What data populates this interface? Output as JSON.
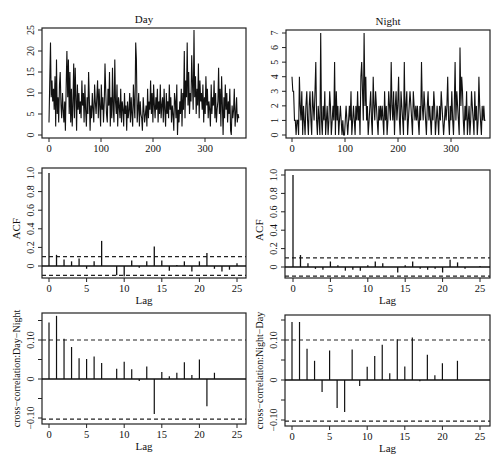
{
  "caption_fragment": "",
  "chart_data": [
    {
      "id": "day-series",
      "type": "line",
      "title": "Day",
      "xlabel": "",
      "ylabel": "",
      "xlim": [
        0,
        365
      ],
      "ylim": [
        0,
        25
      ],
      "xticks": [
        0,
        100,
        200,
        300
      ],
      "yticks": [
        0,
        5,
        10,
        15,
        20,
        25
      ],
      "grid": false,
      "box": {
        "x0": 42,
        "x1": 246,
        "y0": 28,
        "y1": 138,
        "px_x0": 49,
        "px_x1": 205,
        "val_x0": 0,
        "val_x1": 300,
        "px_y0": 135,
        "px_y1": 30,
        "val_y0": 0,
        "val_y1": 25
      },
      "values_sample": [
        3,
        12,
        22,
        9,
        13,
        8,
        11,
        6,
        14,
        2,
        18,
        5,
        9,
        3,
        12,
        15,
        7,
        4,
        10,
        6,
        3,
        8,
        1,
        12,
        20,
        9,
        18,
        5,
        15,
        3,
        11,
        2,
        7,
        17,
        4,
        16,
        9,
        1,
        12,
        6,
        10,
        5,
        8,
        4,
        13,
        7,
        10,
        3,
        12,
        6,
        2,
        9,
        5,
        15,
        8,
        1,
        7,
        4,
        10,
        6,
        3,
        12,
        8,
        5,
        9,
        13,
        4,
        11,
        7,
        2,
        12,
        6,
        9,
        3,
        8,
        17,
        10,
        5,
        3,
        11,
        7,
        15,
        2,
        9,
        4,
        16,
        6,
        3,
        18,
        8,
        5,
        12,
        2,
        9,
        7,
        4,
        11,
        3,
        8,
        6,
        2,
        10,
        5,
        7,
        1,
        8,
        4,
        6,
        10,
        3,
        9,
        5,
        2,
        12,
        7,
        4,
        22,
        18,
        3,
        6,
        10,
        2,
        8,
        5,
        4,
        1,
        9,
        6,
        3,
        5,
        7,
        2,
        11,
        4,
        8,
        6,
        13,
        5,
        10,
        3,
        12,
        7,
        4,
        9,
        6,
        11,
        3,
        8,
        5,
        12,
        4,
        7,
        9,
        3,
        11,
        6,
        2,
        10,
        5,
        8,
        4,
        12,
        6,
        9,
        3,
        7,
        5,
        1,
        10,
        8,
        4,
        12,
        0,
        6,
        3,
        8,
        5,
        11,
        2,
        10,
        6,
        20,
        4,
        13,
        9,
        22,
        7,
        15,
        5,
        10,
        8,
        19,
        12,
        6,
        25,
        9,
        14,
        5,
        11,
        7,
        17,
        4,
        13,
        8,
        10,
        6,
        12,
        3,
        9,
        5,
        14,
        7,
        11,
        4,
        8,
        6,
        2,
        12,
        5,
        9,
        7,
        13,
        4,
        10,
        3,
        6,
        8,
        16,
        5,
        11,
        2,
        14,
        7,
        0,
        9,
        4,
        12,
        6,
        10,
        3,
        8,
        5,
        11,
        1,
        0,
        7,
        4,
        6,
        11,
        2,
        5,
        9,
        3,
        5,
        4
      ]
    },
    {
      "id": "night-series",
      "type": "line",
      "title": "Night",
      "xlabel": "",
      "ylabel": "",
      "xlim": [
        0,
        365
      ],
      "ylim": [
        0,
        7
      ],
      "xticks": [
        0,
        100,
        200,
        300
      ],
      "yticks": [
        0,
        1,
        2,
        3,
        4,
        5,
        6,
        7
      ],
      "grid": false,
      "box": {
        "x0": 286,
        "x1": 490,
        "y0": 30,
        "y1": 138,
        "px_x0": 292,
        "px_x1": 451,
        "val_x0": 0,
        "val_x1": 300,
        "px_y0": 135,
        "px_y1": 33,
        "val_y0": 0,
        "val_y1": 7
      },
      "values_sample": [
        4,
        3,
        3,
        1,
        1,
        0,
        1,
        1,
        0,
        4,
        2,
        1,
        3,
        0,
        2,
        1,
        0,
        2,
        3,
        1,
        0,
        2,
        3,
        1,
        0,
        3,
        2,
        1,
        3,
        5,
        1,
        0,
        2,
        1,
        0,
        7,
        1,
        0,
        2,
        1,
        3,
        0,
        1,
        2,
        0,
        1,
        3,
        2,
        0,
        1,
        2,
        1,
        5,
        0,
        3,
        1,
        2,
        0,
        1,
        2,
        1,
        0,
        1,
        0,
        0,
        1,
        2,
        1,
        0,
        1,
        2,
        1,
        3,
        0,
        1,
        2,
        1,
        0,
        2,
        1,
        3,
        1,
        2,
        0,
        4,
        5,
        3,
        1,
        7,
        2,
        4,
        1,
        2,
        0,
        1,
        2,
        3,
        1,
        0,
        4,
        2,
        1,
        3,
        2,
        1,
        0,
        2,
        1,
        2,
        1,
        2,
        1,
        0,
        3,
        1,
        2,
        0,
        1,
        3,
        2,
        1,
        5,
        2,
        1,
        3,
        0,
        2,
        3,
        1,
        2,
        4,
        1,
        0,
        3,
        2,
        1,
        0,
        5,
        1,
        2,
        3,
        0,
        1,
        2,
        3,
        2,
        1,
        0,
        3,
        2,
        1,
        2,
        1,
        2,
        1,
        0,
        2,
        1,
        5,
        2,
        1,
        3,
        2,
        1,
        0,
        2,
        3,
        1,
        2,
        1,
        0,
        2,
        1,
        3,
        2,
        0,
        1,
        2,
        1,
        0,
        2,
        1,
        3,
        2,
        1,
        0,
        1,
        2,
        1,
        2,
        4,
        1,
        0,
        2,
        1,
        3,
        1,
        0,
        2,
        5,
        1,
        3,
        2,
        1,
        0,
        6,
        2,
        4,
        3,
        1,
        0,
        2,
        1,
        3,
        0,
        1,
        2,
        0,
        1,
        3,
        2,
        1,
        0,
        3,
        1,
        2,
        0,
        1,
        4,
        2,
        1,
        0,
        2,
        1,
        2,
        1,
        1
      ]
    },
    {
      "id": "acf-day",
      "type": "bar",
      "title": "",
      "xlabel": "Lag",
      "ylabel": "ACF",
      "xlim": [
        -1,
        26
      ],
      "ylim": [
        -0.13,
        1.05
      ],
      "xticks": [
        0,
        5,
        10,
        15,
        20,
        25
      ],
      "yticks": [
        0,
        0.2,
        0.4,
        0.6,
        0.8,
        1.0
      ],
      "ytick_labels": [
        "0",
        "0.2",
        "0.4",
        "0.6",
        "0.8",
        "1.0"
      ],
      "confidence_band": [
        0.1,
        -0.1
      ],
      "lags": [
        0,
        1,
        2,
        3,
        4,
        5,
        6,
        7,
        8,
        9,
        10,
        11,
        12,
        13,
        14,
        15,
        16,
        17,
        18,
        19,
        20,
        21,
        22,
        23,
        24,
        25
      ],
      "values": [
        1.0,
        0.12,
        0.07,
        0.05,
        0.08,
        -0.03,
        0.05,
        0.27,
        0.0,
        -0.1,
        -0.11,
        0.06,
        -0.02,
        0.05,
        0.21,
        0.06,
        -0.05,
        0.01,
        0.05,
        -0.06,
        0.05,
        0.14,
        -0.03,
        -0.06,
        -0.04,
        0.03
      ],
      "box": {
        "x0": 42,
        "x1": 246,
        "y0": 168,
        "y1": 278,
        "px_lag0": 49,
        "px_lag25": 237,
        "px_y0": 266,
        "px_y1": 173
      }
    },
    {
      "id": "acf-night",
      "type": "bar",
      "title": "",
      "xlabel": "Lag",
      "ylabel": "ACF",
      "xlim": [
        -1,
        26
      ],
      "ylim": [
        -0.13,
        1.05
      ],
      "xticks": [
        0,
        5,
        10,
        15,
        20,
        25
      ],
      "yticks": [
        0,
        0.2,
        0.4,
        0.6,
        0.8,
        1.0
      ],
      "ytick_labels": [
        "0",
        "0.2",
        "0.4",
        "0.6",
        "0.8",
        "1.0"
      ],
      "confidence_band": [
        0.1,
        -0.1
      ],
      "lags": [
        0,
        1,
        2,
        3,
        4,
        5,
        6,
        7,
        8,
        9,
        10,
        11,
        12,
        13,
        14,
        15,
        16,
        17,
        18,
        19,
        20,
        21,
        22,
        23,
        24,
        25
      ],
      "values": [
        1.0,
        0.13,
        0.04,
        -0.02,
        -0.03,
        0.06,
        0.02,
        -0.04,
        -0.03,
        -0.04,
        0.02,
        0.06,
        0.04,
        0.0,
        -0.06,
        0.02,
        0.06,
        -0.02,
        -0.03,
        -0.02,
        -0.06,
        0.08,
        0.05,
        -0.02,
        0.0,
        0.01
      ],
      "box": {
        "x0": 285,
        "x1": 490,
        "y0": 170,
        "y1": 278,
        "px_lag0": 293,
        "px_lag25": 480,
        "px_y0": 267,
        "px_y1": 175
      }
    },
    {
      "id": "ccf-day-night",
      "type": "bar",
      "title": "",
      "xlabel": "Lag",
      "ylabel": "cross−correlation:Day−Night",
      "xlim": [
        -1,
        26
      ],
      "ylim": [
        -0.115,
        0.16
      ],
      "xticks": [
        0,
        5,
        10,
        15,
        20,
        25
      ],
      "yticks": [
        -0.1,
        -0.05,
        0,
        0.05,
        0.1,
        0.15
      ],
      "ytick_labels": [
        "−0.10",
        "",
        "0",
        "",
        "0.10",
        ""
      ],
      "confidence_band": [
        0.1,
        -0.103
      ],
      "lags": [
        0,
        1,
        2,
        3,
        4,
        5,
        6,
        7,
        8,
        9,
        10,
        11,
        12,
        13,
        14,
        15,
        16,
        17,
        18,
        19,
        20,
        21,
        22
      ],
      "values": [
        0.145,
        0.162,
        0.103,
        0.082,
        0.053,
        0.051,
        0.058,
        0.041,
        null,
        0.026,
        0.044,
        0.025,
        -0.005,
        0.032,
        -0.09,
        0.018,
        0.007,
        0.016,
        0.043,
        0.01,
        0.05,
        -0.07,
        0.016
      ],
      "box": {
        "x0": 42,
        "x1": 246,
        "y0": 313,
        "y1": 424,
        "px_lag0": 49,
        "px_lag25": 237,
        "px_zero": 379,
        "px_010": 340
      }
    },
    {
      "id": "ccf-night-day",
      "type": "bar",
      "title": "",
      "xlabel": "Lag",
      "ylabel": "cross−correlation:Night−Day",
      "xlim": [
        -1,
        26
      ],
      "ylim": [
        -0.115,
        0.16
      ],
      "xticks": [
        0,
        5,
        10,
        15,
        20,
        25
      ],
      "yticks": [
        -0.1,
        -0.05,
        0,
        0.05,
        0.1,
        0.15
      ],
      "ytick_labels": [
        "−0.10",
        "",
        "0",
        "",
        "0.10",
        ""
      ],
      "confidence_band": [
        0.1,
        -0.103
      ],
      "lags": [
        0,
        1,
        2,
        3,
        4,
        5,
        6,
        7,
        8,
        9,
        10,
        11,
        12,
        13,
        14,
        15,
        16,
        17,
        18,
        19,
        20,
        21,
        22
      ],
      "values": [
        0.145,
        0.145,
        0.078,
        0.048,
        -0.03,
        0.074,
        -0.07,
        -0.08,
        0.076,
        -0.015,
        0.033,
        0.06,
        0.088,
        0.017,
        0.102,
        0.034,
        0.106,
        -0.003,
        0.063,
        0.012,
        0.042,
        null,
        0.048
      ],
      "box": {
        "x0": 285,
        "x1": 490,
        "y0": 315,
        "y1": 426,
        "px_lag0": 292,
        "px_lag25": 480,
        "px_zero": 380,
        "px_010": 340
      }
    }
  ]
}
